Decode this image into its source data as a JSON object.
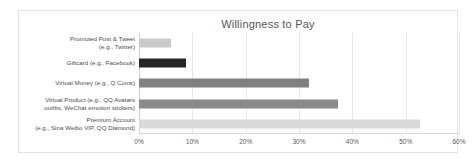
{
  "chart_data": {
    "type": "bar",
    "orientation": "horizontal",
    "title": "Willingness to Pay",
    "xlabel": "",
    "ylabel": "",
    "xlim": [
      0,
      60
    ],
    "xticks": [
      "0%",
      "10%",
      "20%",
      "30%",
      "40%",
      "50%",
      "60%"
    ],
    "xtick_values": [
      0,
      10,
      20,
      30,
      40,
      50,
      60
    ],
    "grid": true,
    "legend": "none",
    "categories": [
      "Promoted Post & Tweet\n(e.g., Twitter)",
      "Giftcard (e.g., Facebook)",
      "Virtual Money (e.g., Q Coins)",
      "Virtual Product (e.g., QQ Avatars\noutfits, WeChat emotion stickers)",
      "Premium Account\n(e.g., Sina Weibo VIP, QQ Diamond)"
    ],
    "values": [
      6.0,
      8.8,
      31.8,
      37.4,
      52.7
    ],
    "bar_colors": [
      "#c9c9c9",
      "#262626",
      "#808080",
      "#8a8a8a",
      "#d9d9d9"
    ]
  }
}
